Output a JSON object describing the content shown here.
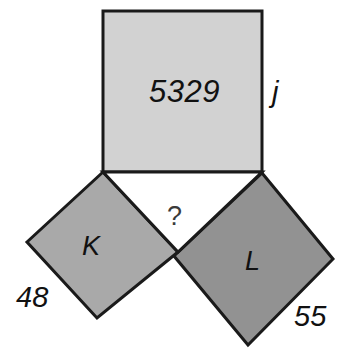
{
  "figure": {
    "type": "geometry-diagram",
    "background_color": "#ffffff",
    "stroke_color": "#1a1a1a",
    "stroke_width": 3
  },
  "shapes": [
    {
      "id": "square-j",
      "name": "upper-square",
      "side_label": "j",
      "area_label": "5329",
      "fill": "#d2d2d2",
      "points": "103,11 262,11 262,172 103,172"
    },
    {
      "id": "square-k",
      "name": "left-square",
      "letter_label": "K",
      "side_label": "48",
      "fill": "#a9a9a9",
      "points": "103,172 178,252 97,318 27,242"
    },
    {
      "id": "square-l",
      "name": "right-square",
      "letter_label": "L",
      "side_label": "55",
      "fill": "#929292",
      "points": "262,173 333,259 248,345 174,256"
    }
  ],
  "triangle": {
    "name": "central-right-triangle",
    "points": "103,172 262,172 178,252",
    "fill": "#ffffff",
    "unknown_label": "?"
  },
  "labels": {
    "area_j": "5329",
    "side_j": "j",
    "square_k": "K",
    "side_48": "48",
    "square_l": "L",
    "side_55": "55",
    "unknown": "?"
  }
}
